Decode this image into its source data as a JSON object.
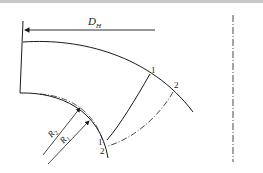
{
  "diagram": {
    "labels": {
      "diameter": "D",
      "diameter_sub": "H",
      "r_outer": "R",
      "r_outer_sub": "2",
      "r_inner": "R",
      "r_inner_sub": "1",
      "point_1_top": "1",
      "point_2_top": "2",
      "point_1_bottom": "1",
      "point_2_bottom": "2"
    },
    "colors": {
      "stroke": "#1a1a1a",
      "background": "#ffffff"
    }
  }
}
